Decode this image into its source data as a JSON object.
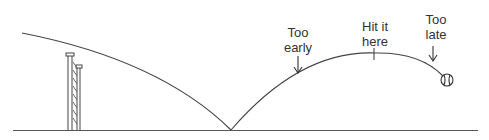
{
  "diagram": {
    "labels": {
      "too_early": [
        "Too",
        "early"
      ],
      "hit_here": [
        "Hit it",
        "here"
      ],
      "too_late": [
        "Too",
        "late"
      ]
    },
    "colors": {
      "line": "#444444",
      "background": "#ffffff"
    }
  }
}
